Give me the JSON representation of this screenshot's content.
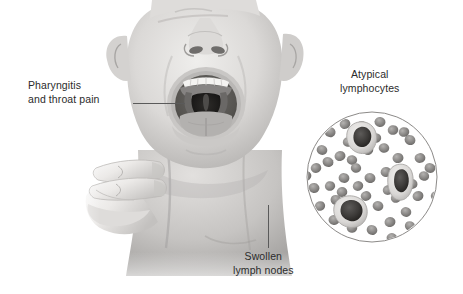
{
  "figure": {
    "style": "grayscale medical illustration",
    "background_color": "#ffffff",
    "text_color": "#2b2b2b",
    "leader_line_color": "#5a5a5a",
    "width": 463,
    "height": 294
  },
  "labels": [
    {
      "id": "pharyngitis",
      "line1": "Pharyngitis",
      "line2": "and throat pain",
      "align": "left",
      "x": 28,
      "y": 79,
      "leader": {
        "type": "h",
        "x": 133,
        "y": 103,
        "length": 52
      }
    },
    {
      "id": "atypical-lymphocytes",
      "line1": "Atypical",
      "line2": "lymphocytes",
      "align": "center",
      "x": 340,
      "y": 68,
      "leader": null
    },
    {
      "id": "swollen-lymph-nodes",
      "line1": "Swollen",
      "line2": "lymph nodes",
      "align": "center",
      "x": 233,
      "y": 250,
      "leader": {
        "type": "v",
        "x": 268,
        "y": 205,
        "length": 43
      }
    }
  ],
  "illustration": {
    "head": {
      "name": "head-with-open-mouth",
      "description": "Front view of a head tilted back with mouth wide open showing inflamed pharynx, tonsils and uvula",
      "skin_tone": "#d8d6d4",
      "shadow_tone": "#a9a7a5",
      "mouth_cavity_tone": "#4a4846"
    },
    "hand": {
      "name": "hand-palpating-neck",
      "description": "Hand with extended fingers palpating the side of the neck to feel enlarged lymph nodes",
      "skin_tone": "#e6e4e2"
    },
    "blood_smear": {
      "name": "blood-smear-circle",
      "description": "Circular microscopic field of a peripheral blood smear",
      "circle": {
        "cx": 372,
        "cy": 177,
        "r": 65,
        "stroke": "#8c8a88"
      },
      "red_blood_cells": {
        "count": 52,
        "fill": "#8e8c8a",
        "radius": 5.2
      },
      "atypical_lymphocytes": [
        {
          "cx": 359,
          "cy": 140,
          "note": "large cell with pale cytoplasm and dark lobed nucleus"
        },
        {
          "cx": 399,
          "cy": 186,
          "note": "large cell with pale cytoplasm and dark irregular nucleus"
        },
        {
          "cx": 349,
          "cy": 212,
          "note": "large cell with pale cytoplasm and dark dense nucleus"
        }
      ]
    }
  }
}
